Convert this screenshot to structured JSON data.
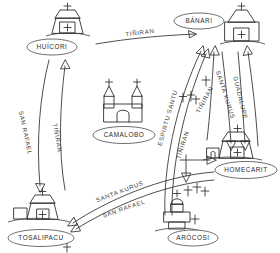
{
  "diagram": {
    "style": "hand-drawn line diagram",
    "ink_color": "#2e2e2e",
    "background_color": "#ffffff"
  },
  "nodes": [
    {
      "id": "huicori",
      "label": "HUÍCORI",
      "x": 65,
      "y": 47,
      "church": "trapezoid-church"
    },
    {
      "id": "banari",
      "label": "BÁNARI",
      "x": 200,
      "y": 21,
      "church": "trapezoid-church"
    },
    {
      "id": "camalobo",
      "label": "CAMALOBO",
      "x": 125,
      "y": 136,
      "church": "twin-tower-church"
    },
    {
      "id": "homecarit",
      "label": "HOMECARIT",
      "x": 247,
      "y": 170,
      "church": "trapezoid-church"
    },
    {
      "id": "arocosi",
      "label": "ARÓCOSI",
      "x": 195,
      "y": 238,
      "church": "domed-church"
    },
    {
      "id": "tosalipacu",
      "label": "TOSALIPACU",
      "x": 42,
      "y": 238,
      "church": "trapezoid-church"
    }
  ],
  "routes": [
    {
      "id": "r1",
      "label": "TIÑIRAN",
      "from": "huicori",
      "to": "banari",
      "rotation": -7
    },
    {
      "id": "r2",
      "label": "SAN RAFAEL",
      "from": "huicori",
      "to": "tosalipacu",
      "rotation": 78
    },
    {
      "id": "r3",
      "label": "TIÑIRAN",
      "from": "tosalipacu",
      "to": "huicori",
      "rotation": 80
    },
    {
      "id": "r4",
      "label": "ESPIRTU SANTU",
      "from": "arocosi",
      "to": "banari",
      "rotation": -74
    },
    {
      "id": "r5",
      "label": "TIÑIRAN",
      "from": "arocosi",
      "to": "banari",
      "rotation": -72
    },
    {
      "id": "r6",
      "label": "TIÑIRAN",
      "from": "homecarit",
      "to": "banari",
      "rotation": -62
    },
    {
      "id": "r7",
      "label": "SANTA KURUS",
      "from": "banari",
      "to": "homecarit",
      "rotation": 72
    },
    {
      "id": "r8",
      "label": "GUADALUPE",
      "from": "banari",
      "to": "homecarit",
      "rotation": 76
    },
    {
      "id": "r9",
      "label": "SANTA KURUS",
      "from": "homecarit",
      "to": "tosalipacu",
      "rotation": -21
    },
    {
      "id": "r10",
      "label": "SAN RAFAEL",
      "from": "homecarit",
      "to": "tosalipacu",
      "rotation": -19
    }
  ],
  "icons": {
    "church": "church-icon",
    "cross": "cross-icon",
    "arrow": "arrow-icon"
  }
}
